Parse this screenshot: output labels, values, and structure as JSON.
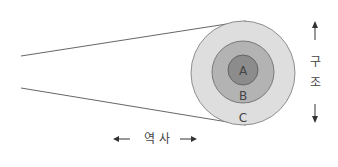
{
  "diagram": {
    "type": "concentric-circles-with-cone",
    "layers": [
      {
        "id": "A",
        "label": "A",
        "fill": "#8c8c8c",
        "r": 15
      },
      {
        "id": "B",
        "label": "B",
        "fill": "#b3b3b3",
        "r": 31
      },
      {
        "id": "C",
        "label": "C",
        "fill": "#dedede",
        "r": 52
      }
    ],
    "axis_horizontal": {
      "label": "역 사",
      "left_arrow": "←",
      "right_arrow": "→"
    },
    "axis_vertical": {
      "label_chars": [
        "구",
        "조"
      ],
      "up_arrow": "↑",
      "down_arrow": "↓"
    }
  }
}
